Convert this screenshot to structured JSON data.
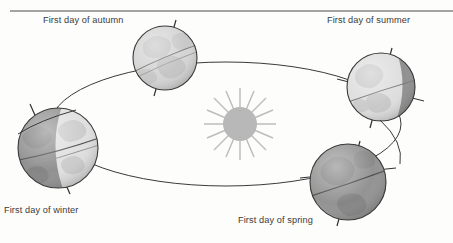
{
  "figure": {
    "title_visible": false,
    "background_color": "#fdfdfc",
    "border": {
      "top_rule_visible": true,
      "top_rule_color": "#4a4a4a"
    }
  },
  "sun": {
    "name": "Sun",
    "label_visible": false,
    "center_x": 240,
    "center_y": 124,
    "radius": 17,
    "ray_count": 16,
    "body_color": "#b8b8b8",
    "ray_color": "#bdbdbd"
  },
  "orbit": {
    "name": "Earth orbital path",
    "shape": "ellipse",
    "center_x": 226,
    "center_y": 124,
    "radius_x": 175,
    "radius_y": 62,
    "stroke_color": "#3a3a3a",
    "stroke_width": 1
  },
  "earth_positions": [
    {
      "id": "autumn",
      "label": "First day of autumn",
      "position": "top-left",
      "center_x": 165,
      "center_y": 58,
      "radius": 32,
      "lit_side": "full",
      "lit_fraction": 0.95,
      "lit_color": "#d2d2d2",
      "dark_color": "#c4c4c4",
      "axis_tilt_degrees": 23.5,
      "axis_direction": "upper-left"
    },
    {
      "id": "summer",
      "label": "First day of summer",
      "position": "right",
      "center_x": 381,
      "center_y": 87,
      "radius": 34,
      "lit_side": "left",
      "lit_fraction": 0.68,
      "lit_color": "#dcdcdc",
      "dark_color": "#8a8a8a",
      "axis_tilt_degrees": 23.5,
      "axis_direction": "upper-left"
    },
    {
      "id": "spring",
      "label": "First day of spring",
      "position": "bottom-right",
      "center_x": 348,
      "center_y": 182,
      "radius": 38,
      "lit_side": "none",
      "lit_fraction": 0.08,
      "lit_color": "#d8d8d8",
      "dark_color": "#8d8d8d",
      "axis_tilt_degrees": 23.5,
      "axis_direction": "upper-left"
    },
    {
      "id": "winter",
      "label": "First day of winter",
      "position": "left",
      "center_x": 58,
      "center_y": 148,
      "radius": 40,
      "lit_side": "right",
      "lit_fraction": 0.38,
      "lit_color": "#dedede",
      "dark_color": "#8b8b8b",
      "axis_tilt_degrees": 23.5,
      "axis_direction": "upper-left"
    }
  ],
  "colors": {
    "outline": "#3a3a3a",
    "text": "#3b3b3b",
    "land_light": "#c9c9c9",
    "land_dark": "#7e7e7e",
    "ocean_light": "#ededed",
    "ocean_dark": "#989898"
  }
}
